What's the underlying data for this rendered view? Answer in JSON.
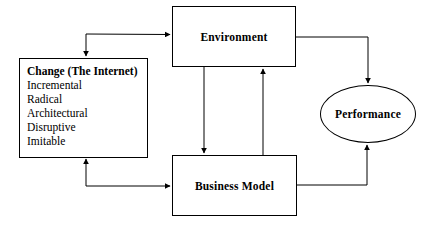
{
  "diagram": {
    "background_color": "#ffffff",
    "line_color": "#000000",
    "nodes": {
      "environment": {
        "label": "Environment",
        "shape": "rectangle"
      },
      "business_model": {
        "label": "Business Model",
        "shape": "rectangle"
      },
      "performance": {
        "label": "Performance",
        "shape": "ellipse"
      },
      "change": {
        "title": "Change (The Internet)",
        "shape": "rectangle",
        "items": [
          "Incremental",
          "Radical",
          "Architectural",
          "Disruptive",
          "Imitable"
        ]
      }
    },
    "connectors": [
      {
        "name": "change-to-environment",
        "from": "change",
        "to": "environment",
        "style": "elbow",
        "arrowhead": "end"
      },
      {
        "name": "branch-into-change-top",
        "from": "change",
        "to": "change",
        "style": "elbow",
        "arrowhead": "end"
      },
      {
        "name": "environment-to-business-model",
        "from": "environment",
        "to": "business_model",
        "style": "straight",
        "arrowhead": "end"
      },
      {
        "name": "business-model-to-environment",
        "from": "business_model",
        "to": "environment",
        "style": "straight",
        "arrowhead": "end"
      },
      {
        "name": "environment-to-performance",
        "from": "environment",
        "to": "performance",
        "style": "elbow",
        "arrowhead": "end"
      },
      {
        "name": "business-model-to-performance",
        "from": "business_model",
        "to": "performance",
        "style": "elbow",
        "arrowhead": "end"
      },
      {
        "name": "business-model-to-change",
        "from": "business_model",
        "to": "change",
        "style": "elbow",
        "arrowhead": "end"
      }
    ]
  }
}
